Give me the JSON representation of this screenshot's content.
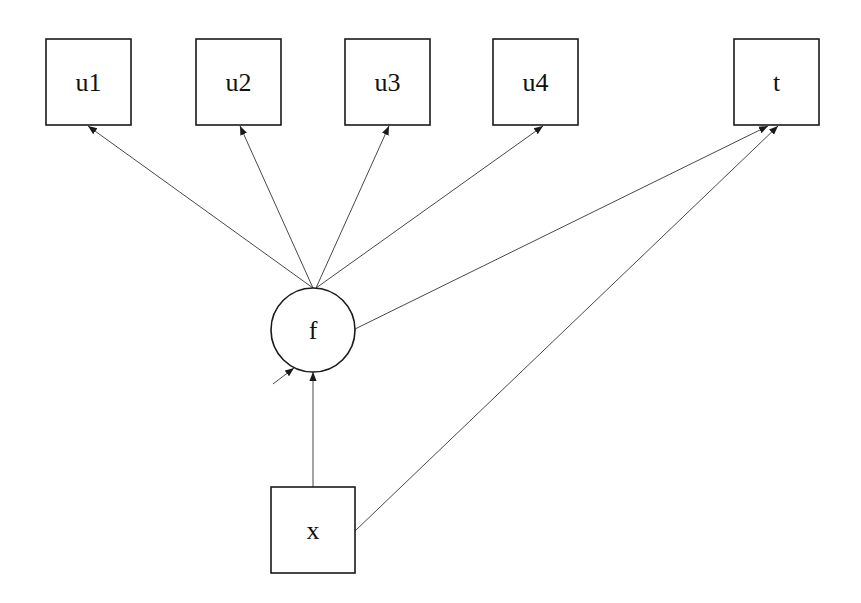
{
  "diagram": {
    "type": "path-diagram",
    "nodes": [
      {
        "id": "u1",
        "label": "u1",
        "shape": "rect",
        "x": 46,
        "y": 39,
        "w": 85,
        "h": 86
      },
      {
        "id": "u2",
        "label": "u2",
        "shape": "rect",
        "x": 196,
        "y": 39,
        "w": 85,
        "h": 86
      },
      {
        "id": "u3",
        "label": "u3",
        "shape": "rect",
        "x": 345,
        "y": 39,
        "w": 85,
        "h": 86
      },
      {
        "id": "u4",
        "label": "u4",
        "shape": "rect",
        "x": 493,
        "y": 39,
        "w": 85,
        "h": 86
      },
      {
        "id": "t",
        "label": "t",
        "shape": "rect",
        "x": 734,
        "y": 39,
        "w": 85,
        "h": 86
      },
      {
        "id": "f",
        "label": "f",
        "shape": "circle",
        "cx": 313,
        "cy": 330,
        "r": 42
      },
      {
        "id": "x",
        "label": "x",
        "shape": "rect",
        "x": 271,
        "y": 487,
        "w": 84,
        "h": 86
      }
    ],
    "edges": [
      {
        "from": "f",
        "to": "u1"
      },
      {
        "from": "f",
        "to": "u2"
      },
      {
        "from": "f",
        "to": "u3"
      },
      {
        "from": "f",
        "to": "u4"
      },
      {
        "from": "f",
        "to": "t"
      },
      {
        "from": "x",
        "to": "f"
      },
      {
        "from": "x",
        "to": "t"
      },
      {
        "from": "residual",
        "to": "f"
      }
    ]
  },
  "labels": {
    "u1": "u1",
    "u2": "u2",
    "u3": "u3",
    "u4": "u4",
    "t": "t",
    "f": "f",
    "x": "x"
  }
}
